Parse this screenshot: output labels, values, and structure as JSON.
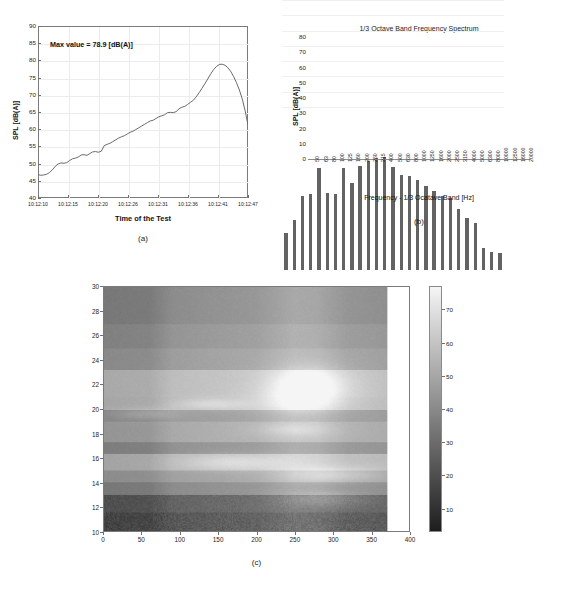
{
  "figure": {
    "captions": {
      "a": "(a)",
      "b": "(b)",
      "c": "(c)"
    }
  },
  "chart_data": [
    {
      "id": "panel-a",
      "type": "line",
      "title": "",
      "annotation": "Max value = 78.9 [dB(A)]",
      "xlabel": "Time of the Test",
      "ylabel": "SPL [dB(A)]",
      "ylim": [
        40,
        90
      ],
      "yticks": [
        40,
        45,
        50,
        55,
        60,
        65,
        70,
        75,
        80,
        85,
        90
      ],
      "xticks": [
        "10:12:10",
        "10:12:15",
        "10:12:20",
        "10:12:26",
        "10:12:31",
        "10:12:36",
        "10:12:41",
        "10:12:47"
      ],
      "grid": true,
      "x": [
        0,
        1,
        2,
        3,
        4,
        5,
        6,
        7,
        8,
        9,
        10,
        11,
        12,
        13,
        14,
        15,
        16,
        17,
        18,
        19,
        20,
        21,
        22,
        23,
        24,
        25,
        26,
        27,
        28,
        29,
        30,
        31,
        32,
        33,
        34,
        35,
        36,
        37,
        38,
        39,
        40,
        41,
        42,
        43,
        44,
        45,
        46,
        47,
        48,
        49,
        50,
        51,
        52,
        53,
        54,
        55,
        56,
        57,
        58,
        59,
        60,
        61,
        62,
        63,
        64,
        65,
        66,
        67,
        68,
        69,
        70,
        71,
        72,
        73
      ],
      "values": [
        46.8,
        46.6,
        46.7,
        46.9,
        47.4,
        48.2,
        49.2,
        49.9,
        50.2,
        50.1,
        50.3,
        50.9,
        51.4,
        51.6,
        51.9,
        52.5,
        52.6,
        52.4,
        52.9,
        53.4,
        53.5,
        53.3,
        53.6,
        55.2,
        55.6,
        55.9,
        56.4,
        56.9,
        57.4,
        57.8,
        58.1,
        58.6,
        59.1,
        59.4,
        59.9,
        60.4,
        60.9,
        61.4,
        61.9,
        62.4,
        62.6,
        63.1,
        63.6,
        63.9,
        64.2,
        64.8,
        64.9,
        64.8,
        65.1,
        65.9,
        66.4,
        66.6,
        67.2,
        67.8,
        68.4,
        69.4,
        70.6,
        71.9,
        73.2,
        74.6,
        76.0,
        77.3,
        78.2,
        78.8,
        78.9,
        78.6,
        77.9,
        76.8,
        75.3,
        73.5,
        71.4,
        68.8,
        65.4,
        61.2
      ],
      "line_color": "#6b6b6b"
    },
    {
      "id": "panel-b",
      "type": "bar",
      "title": "1/3 Octave Band Frequency Spectrum",
      "xlabel": "Frequency - 1/3 Ocatave Band [Hz]",
      "ylabel": "SPL [dB(A)]",
      "ylim": [
        0,
        80
      ],
      "yticks": [
        0,
        10,
        20,
        30,
        40,
        50,
        60,
        70,
        80
      ],
      "categories": [
        "50",
        "63",
        "80",
        "100",
        "125",
        "160",
        "200",
        "250",
        "315",
        "400",
        "500",
        "630",
        "800",
        "1000",
        "1250",
        "1600",
        "2000",
        "2500",
        "3150",
        "4000",
        "5000",
        "6300",
        "8000",
        "10000",
        "12500",
        "16000",
        "20000"
      ],
      "values": [
        24.5,
        32.5,
        48.5,
        50.0,
        67.0,
        50.8,
        50.0,
        67.2,
        57.3,
        68.0,
        71.5,
        73.3,
        74.0,
        67.3,
        62.2,
        61.8,
        59.0,
        55.3,
        52.0,
        48.5,
        47.0,
        40.0,
        34.0,
        30.8,
        14.3,
        11.8,
        11.2
      ],
      "bar_color": "#636363"
    },
    {
      "id": "panel-c",
      "type": "heatmap",
      "title": "",
      "xlabel": "",
      "ylabel": "",
      "xlim": [
        0,
        400
      ],
      "ylim": [
        10,
        30
      ],
      "xticks": [
        0,
        50,
        100,
        150,
        200,
        250,
        300,
        350,
        400
      ],
      "yticks": [
        10,
        12,
        14,
        16,
        18,
        20,
        22,
        24,
        26,
        28,
        30
      ],
      "data_x_extent": [
        0,
        372
      ],
      "colorbar": {
        "ticks": [
          10,
          20,
          30,
          40,
          50,
          60,
          70
        ],
        "range": [
          3,
          77
        ],
        "colormap": "gray"
      },
      "row_bands": [
        {
          "y0": 10.0,
          "y1": 11.5,
          "base": 22,
          "noise": 9
        },
        {
          "y0": 11.5,
          "y1": 13.0,
          "base": 26,
          "noise": 6
        },
        {
          "y0": 13.0,
          "y1": 14.0,
          "base": 40,
          "noise": 2
        },
        {
          "y0": 14.0,
          "y1": 15.0,
          "base": 47,
          "noise": 2
        },
        {
          "y0": 15.0,
          "y1": 16.3,
          "base": 55,
          "noise": 2
        },
        {
          "y0": 16.3,
          "y1": 17.3,
          "base": 42,
          "noise": 2
        },
        {
          "y0": 17.3,
          "y1": 19.0,
          "base": 50,
          "noise": 2
        },
        {
          "y0": 19.0,
          "y1": 19.9,
          "base": 45,
          "noise": 2
        },
        {
          "y0": 19.9,
          "y1": 21.0,
          "base": 56,
          "noise": 2
        },
        {
          "y0": 21.0,
          "y1": 23.2,
          "base": 57,
          "noise": 2
        },
        {
          "y0": 23.2,
          "y1": 25.0,
          "base": 46,
          "noise": 2
        },
        {
          "y0": 25.0,
          "y1": 27.0,
          "base": 43,
          "noise": 2
        },
        {
          "y0": 27.0,
          "y1": 30.0,
          "base": 40,
          "noise": 2
        }
      ],
      "column_profile": [
        {
          "x": 0,
          "gain": -6
        },
        {
          "x": 60,
          "gain": -5
        },
        {
          "x": 90,
          "gain": 1
        },
        {
          "x": 140,
          "gain": 3
        },
        {
          "x": 200,
          "gain": 5
        },
        {
          "x": 250,
          "gain": 11
        },
        {
          "x": 280,
          "gain": 10
        },
        {
          "x": 320,
          "gain": 4
        },
        {
          "x": 372,
          "gain": 2
        }
      ],
      "bright_blobs": [
        {
          "cx": 270,
          "cy": 22.0,
          "rx": 55,
          "ry": 1.6,
          "amp": 17
        },
        {
          "cx": 255,
          "cy": 20.5,
          "rx": 60,
          "ry": 1.2,
          "amp": 10
        },
        {
          "cx": 300,
          "cy": 14.6,
          "rx": 70,
          "ry": 0.7,
          "amp": 12
        },
        {
          "cx": 170,
          "cy": 15.6,
          "rx": 75,
          "ry": 0.7,
          "amp": 10
        },
        {
          "cx": 140,
          "cy": 20.4,
          "rx": 50,
          "ry": 0.5,
          "amp": 9
        },
        {
          "cx": 55,
          "cy": 19.6,
          "rx": 45,
          "ry": 0.5,
          "amp": 8
        },
        {
          "cx": 250,
          "cy": 18.3,
          "rx": 55,
          "ry": 0.6,
          "amp": 8
        },
        {
          "cx": 290,
          "cy": 12.6,
          "rx": 60,
          "ry": 0.7,
          "amp": 10
        }
      ]
    }
  ]
}
